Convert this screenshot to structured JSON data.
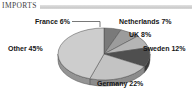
{
  "chart_data": {
    "type": "pie",
    "title": "IMPORTS",
    "style": "3d",
    "start_angle_deg": 0,
    "direction": "clockwise",
    "unit": "%",
    "legend_position": "none",
    "slices": [
      {
        "name": "France",
        "value": 6,
        "label": "France 6%",
        "color": "#7a7a7a"
      },
      {
        "name": "Netherlands",
        "value": 7,
        "label": "Netherlands 7%",
        "color": "#9c9c9c"
      },
      {
        "name": "UK",
        "value": 8,
        "label": "UK 8%",
        "color": "#b5b5b5"
      },
      {
        "name": "Sweden",
        "value": 12,
        "label": "Sweden 12%",
        "color": "#4f4f4f"
      },
      {
        "name": "Germany",
        "value": 22,
        "label": "Germany 22%",
        "color": "#c3c3c3"
      },
      {
        "name": "Other",
        "value": 45,
        "label": "Other 45%",
        "color": "#cdcdcd"
      }
    ]
  },
  "colors": {
    "background": "#ffffff",
    "title_color": "#3f3f3f",
    "label_color": "#161616",
    "title_bar_color": "#d4d4d4",
    "slice_outline": "#4a4a4a"
  }
}
